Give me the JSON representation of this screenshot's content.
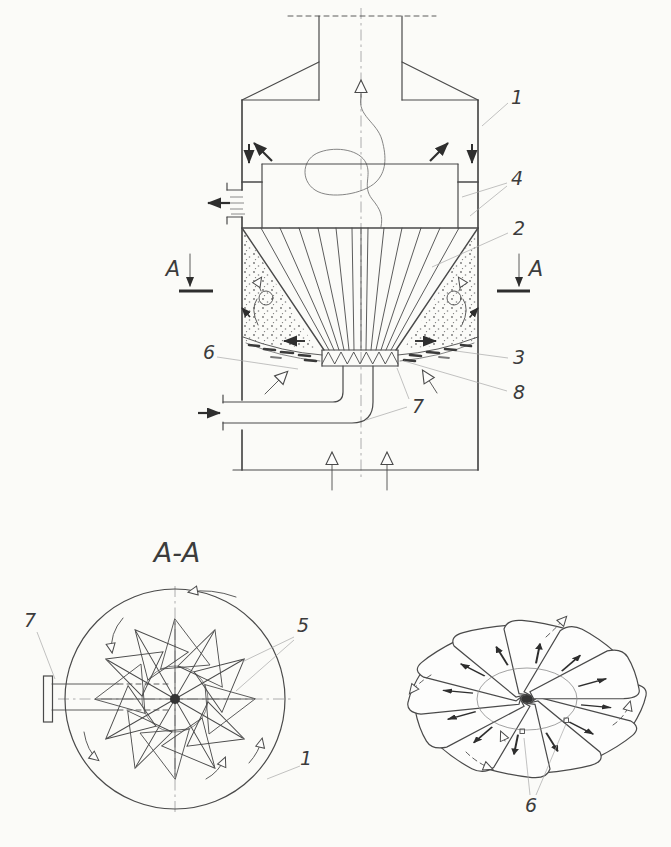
{
  "colors": {
    "background": "#fbfbf8",
    "paper": "#fdfdfc",
    "line": "#4a4a4a",
    "dark": "#2e2e2e",
    "label": "#3c3c3c",
    "leader": "#a8a8a8"
  },
  "main_view": {
    "section_marker_left": "A",
    "section_marker_right": "A",
    "labels": {
      "n1": "1",
      "n2": "2",
      "n3": "3",
      "n4": "4",
      "n6": "6",
      "n7": "7",
      "n8": "8"
    }
  },
  "section_view": {
    "title": "A-A",
    "labels": {
      "n7": "7",
      "n5": "5",
      "n1": "1"
    }
  },
  "perspective_view": {
    "labels": {
      "n6": "6"
    }
  }
}
